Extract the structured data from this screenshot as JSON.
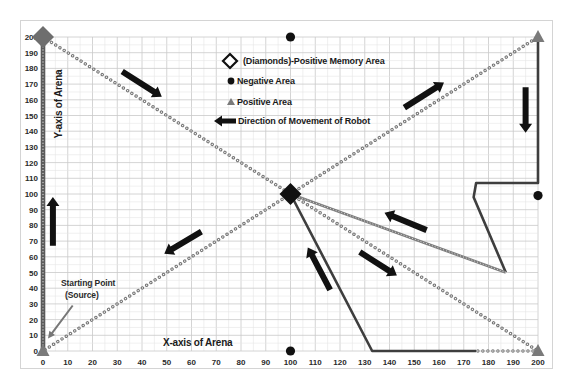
{
  "chart_data": {
    "type": "line",
    "title": "",
    "xlabel": "X-axis of Arena",
    "ylabel": "Y-axis of Arena",
    "xlim": [
      0,
      200
    ],
    "ylim": [
      0,
      200
    ],
    "x_ticks": [
      0,
      10,
      20,
      30,
      40,
      50,
      60,
      70,
      80,
      90,
      100,
      110,
      120,
      130,
      140,
      150,
      160,
      170,
      180,
      190,
      200
    ],
    "y_ticks": [
      0,
      10,
      20,
      30,
      40,
      50,
      60,
      70,
      80,
      90,
      100,
      110,
      120,
      130,
      140,
      150,
      160,
      170,
      180,
      190,
      200
    ],
    "grid": {
      "on": true,
      "major_step": 10,
      "minor_step": 5
    },
    "legend": {
      "position": "upper center",
      "entries": [
        {
          "symbol": "diamond-outline",
          "label": "(Diamonds)-Positive  Memory Area"
        },
        {
          "symbol": "circle",
          "label": "Negative Area"
        },
        {
          "symbol": "triangle",
          "label": "Positive Area"
        },
        {
          "symbol": "arrow",
          "label": "Direction of Movement of Robot"
        }
      ]
    },
    "colors": {
      "diamond_corner": "#6e6e6e",
      "diamond_center": "#111111",
      "negative": "#111111",
      "positive": "#7a7a7a",
      "arrow": "#111111",
      "pointer": "#777777"
    },
    "series": [
      {
        "name": "Source up left wall",
        "style": "thick",
        "points": [
          [
            0,
            0
          ],
          [
            0,
            200
          ]
        ]
      },
      {
        "name": "Diagonal to center",
        "style": "dotted",
        "points": [
          [
            0,
            200
          ],
          [
            100,
            100
          ]
        ]
      },
      {
        "name": "Center to top-right",
        "style": "dotted",
        "points": [
          [
            100,
            100
          ],
          [
            200,
            200
          ]
        ]
      },
      {
        "name": "Right wall and detour",
        "style": "solid",
        "points": [
          [
            200,
            200
          ],
          [
            200,
            107
          ],
          [
            175,
            107
          ],
          [
            174,
            98
          ],
          [
            187,
            50
          ]
        ]
      },
      {
        "name": "Detour back to center",
        "style": "chain",
        "points": [
          [
            187,
            50
          ],
          [
            100,
            100
          ]
        ]
      },
      {
        "name": "Center to bottom-right",
        "style": "dotted",
        "points": [
          [
            100,
            100
          ],
          [
            200,
            0
          ]
        ]
      },
      {
        "name": "Bottom edge (dotted part)",
        "style": "dotted",
        "points": [
          [
            200,
            0
          ],
          [
            175,
            0
          ]
        ]
      },
      {
        "name": "Bottom edge and return to center",
        "style": "solid",
        "points": [
          [
            175,
            0
          ],
          [
            133,
            0
          ],
          [
            100,
            100
          ]
        ]
      },
      {
        "name": "Center to source",
        "style": "dotted",
        "points": [
          [
            100,
            100
          ],
          [
            0,
            0
          ]
        ]
      }
    ],
    "markers": {
      "diamonds": [
        {
          "x": 0,
          "y": 200,
          "color_key": "diamond_corner"
        },
        {
          "x": 100,
          "y": 100,
          "color_key": "diamond_center"
        }
      ],
      "negative": [
        {
          "x": 100,
          "y": 200
        },
        {
          "x": 100,
          "y": 0
        },
        {
          "x": 200,
          "y": 99
        }
      ],
      "positive": [
        {
          "x": 0,
          "y": 0
        },
        {
          "x": 200,
          "y": 200
        },
        {
          "x": 200,
          "y": 0
        }
      ]
    },
    "arrows": [
      {
        "from": [
          32,
          178
        ],
        "to": [
          48,
          162
        ]
      },
      {
        "from": [
          146,
          155
        ],
        "to": [
          162,
          171
        ]
      },
      {
        "from": [
          195,
          168
        ],
        "to": [
          195,
          139
        ]
      },
      {
        "from": [
          4,
          67
        ],
        "to": [
          4,
          98
        ]
      },
      {
        "from": [
          64,
          76
        ],
        "to": [
          49,
          62
        ]
      },
      {
        "from": [
          116,
          39
        ],
        "to": [
          107,
          66
        ]
      },
      {
        "from": [
          155,
          77
        ],
        "to": [
          138,
          88
        ]
      },
      {
        "from": [
          128,
          63
        ],
        "to": [
          143,
          48
        ]
      }
    ],
    "annotations": [
      {
        "lines": [
          "Starting Point",
          "(Source)"
        ],
        "pointer_from": [
          12,
          29
        ],
        "pointer_to": [
          2,
          8
        ]
      }
    ]
  }
}
